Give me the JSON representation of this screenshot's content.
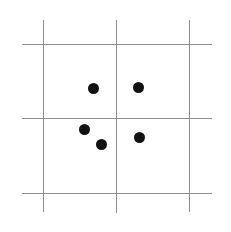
{
  "figure": {
    "width": 231,
    "height": 232,
    "background_color": "#ffffff",
    "line_color": "#8d8d8d",
    "dot_color": "#111111"
  },
  "chart_data": {
    "type": "scatter",
    "title": "",
    "subtitle": "",
    "xlabel": "",
    "ylabel": "",
    "grid": true,
    "legend": "none",
    "xlim": [
      0,
      231
    ],
    "ylim": [
      232,
      0
    ],
    "tick_labels_x": [],
    "tick_labels_y": [],
    "annotations": [],
    "gridlines": {
      "vertical_x": [
        43,
        116,
        189
      ],
      "horizontal_y": [
        44,
        118,
        193
      ]
    },
    "points": [
      {
        "label": "p1",
        "x": 93,
        "y": 88
      },
      {
        "label": "p2",
        "x": 138,
        "y": 87
      },
      {
        "label": "p3",
        "x": 84,
        "y": 129
      },
      {
        "label": "p4",
        "x": 101,
        "y": 144
      },
      {
        "label": "p5",
        "x": 139,
        "y": 137
      }
    ],
    "point_count": 5,
    "point_radius": 5.5
  },
  "lines": {
    "vertical": [
      {
        "name": "vertical-line-left",
        "x": 43,
        "y_start": 20,
        "y_end": 212
      },
      {
        "name": "vertical-line-middle",
        "x": 116,
        "y_start": 20,
        "y_end": 213
      },
      {
        "name": "vertical-line-right",
        "x": 189,
        "y_start": 20,
        "y_end": 212
      }
    ],
    "horizontal": [
      {
        "name": "horizontal-line-top",
        "y": 44,
        "x_start": 22,
        "x_end": 212
      },
      {
        "name": "horizontal-line-middle",
        "y": 118,
        "x_start": 22,
        "x_end": 212
      },
      {
        "name": "horizontal-line-bottom",
        "y": 193,
        "x_start": 22,
        "x_end": 212
      }
    ]
  }
}
